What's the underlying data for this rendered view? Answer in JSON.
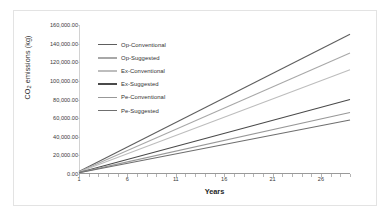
{
  "chart_data": {
    "type": "line",
    "title": "",
    "xlabel": "Years",
    "ylabel": "CO2 emissions (kg)",
    "ylabel_prefix": "CO",
    "ylabel_sub": "2",
    "ylabel_suffix": " emissions (kg)",
    "xlim": [
      1,
      29
    ],
    "ylim": [
      0,
      160000
    ],
    "grid": false,
    "legend_position": "upper-left-inside",
    "x_ticks": [
      1,
      6,
      11,
      16,
      21,
      26
    ],
    "x_tick_labels": [
      "1",
      "6",
      "11",
      "16",
      "21",
      "26"
    ],
    "y_ticks": [
      0,
      20000,
      40000,
      60000,
      80000,
      100000,
      120000,
      140000,
      160000
    ],
    "y_tick_labels": [
      "0.00",
      "20,000.00",
      "40,000.00",
      "60,000.00",
      "80,000.00",
      "100,000.00",
      "120,000.00",
      "140,000.00",
      "160,000.00"
    ],
    "x": [
      1,
      29
    ],
    "series": [
      {
        "name": "Op-Conventional",
        "color": "#5e5e5e",
        "values": [
          2600,
          150000
        ],
        "end_value": 150000
      },
      {
        "name": "Op-Suggested",
        "color": "#a8a8a8",
        "values": [
          2400,
          130000
        ],
        "end_value": 130000
      },
      {
        "name": "Ex-Conventional",
        "color": "#bdbdbd",
        "values": [
          2200,
          112000
        ],
        "end_value": 112000
      },
      {
        "name": "Ex-Suggested",
        "color": "#4a4a4a",
        "values": [
          1700,
          80000
        ],
        "end_value": 80000
      },
      {
        "name": "Pe-Conventional",
        "color": "#989898",
        "values": [
          1500,
          66000
        ],
        "end_value": 66000
      },
      {
        "name": "Pe-Suggested",
        "color": "#6f6f6f",
        "values": [
          1300,
          58000
        ],
        "end_value": 58000
      }
    ]
  },
  "legend": {
    "items": [
      {
        "label": "Op-Conventional"
      },
      {
        "label": "Op-Suggested"
      },
      {
        "label": "Ex-Conventional"
      },
      {
        "label": "Ex-Suggested"
      },
      {
        "label": "Pe-Conventional"
      },
      {
        "label": "Pe-Suggested"
      }
    ]
  }
}
